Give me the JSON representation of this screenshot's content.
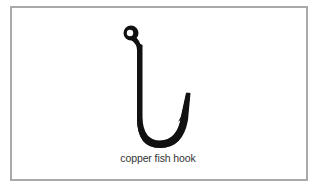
{
  "image": {
    "subject_icon": "fish-hook-icon",
    "caption": "copper fish hook",
    "colors": {
      "border": "#a9a9a9",
      "hook": "#111111",
      "caption": "#333333",
      "background": "#ffffff"
    }
  }
}
